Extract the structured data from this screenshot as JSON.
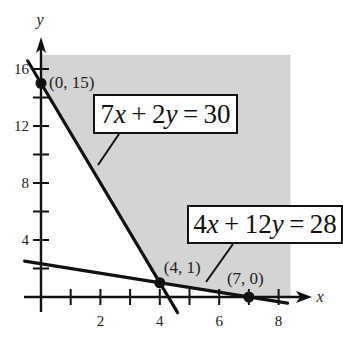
{
  "chart_data": {
    "type": "line",
    "title": "",
    "xlabel": "x",
    "ylabel": "y",
    "xlim": [
      0,
      8.5
    ],
    "ylim": [
      0,
      17
    ],
    "x_ticks": [
      1,
      2,
      3,
      4,
      5,
      6,
      7,
      8
    ],
    "x_tick_labels": {
      "2": "2",
      "4": "4",
      "6": "6",
      "8": "8"
    },
    "y_ticks": [
      2,
      4,
      6,
      8,
      10,
      12,
      14,
      16
    ],
    "y_tick_labels": {
      "4": "4",
      "8": "8",
      "12": "12",
      "16": "16"
    },
    "shaded_region": {
      "description": "feasible region above both lines, x >= 0, y >= 0",
      "fill_color": "#d4d4d4",
      "vertices": [
        [
          0,
          17
        ],
        [
          0,
          15
        ],
        [
          4,
          1
        ],
        [
          7,
          0
        ],
        [
          8.4,
          0
        ],
        [
          8.4,
          17
        ]
      ]
    },
    "series": [
      {
        "name": "7x + 2y = 30",
        "equation": {
          "a": 7,
          "b": 2,
          "c": 30
        },
        "x_range": [
          -0.45,
          4.6
        ],
        "color": "#111111"
      },
      {
        "name": "4x + 12y = 28",
        "equation": {
          "a": 4,
          "b": 12,
          "c": 28
        },
        "x_range": [
          -0.55,
          8.3
        ],
        "color": "#111111"
      }
    ],
    "points": [
      {
        "x": 0,
        "y": 15,
        "label": "(0, 15)"
      },
      {
        "x": 4,
        "y": 1,
        "label": "(4, 1)"
      },
      {
        "x": 7,
        "y": 0,
        "label": "(7, 0)"
      }
    ],
    "annotations": [
      {
        "text": "7x + 2y = 30",
        "parts": [
          [
            "7",
            false
          ],
          [
            "x",
            true
          ],
          [
            " + 2",
            false
          ],
          [
            "y",
            true
          ],
          [
            " = 30",
            false
          ]
        ],
        "points_to_series": 0
      },
      {
        "text": "4x + 12y = 28",
        "parts": [
          [
            "4",
            false
          ],
          [
            "x",
            true
          ],
          [
            " + 12",
            false
          ],
          [
            "y",
            true
          ],
          [
            " = 28",
            false
          ]
        ],
        "points_to_series": 1
      }
    ],
    "grid": false,
    "legend": "none"
  }
}
